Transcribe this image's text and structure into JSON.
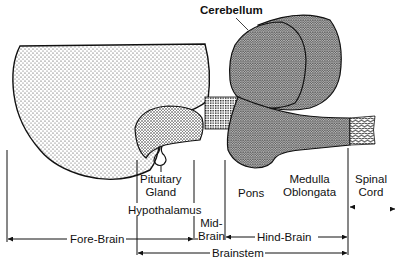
{
  "diagram": {
    "type": "anatomical-brain-lateral-section",
    "structures": {
      "cerebellum": "Cerebellum",
      "pituitary_gland": [
        "Pituitary",
        "Gland"
      ],
      "hypothalamus": "Hypothalamus",
      "pons": "Pons",
      "medulla_oblongata": [
        "Medulla",
        "Oblongata"
      ],
      "spinal_cord": [
        "Spinal",
        "Cord"
      ]
    },
    "regions": {
      "fore_brain": "Fore-Brain",
      "mid_brain": [
        "Mid-",
        "Brain"
      ],
      "hind_brain": "Hind-Brain",
      "brainstem": "Brainstem"
    },
    "colors": {
      "outline": "#111111",
      "fill": "#ffffff",
      "dots": "#222222"
    }
  }
}
